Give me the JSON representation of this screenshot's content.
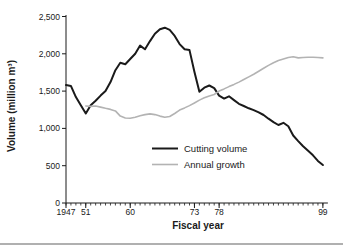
{
  "page": {
    "background": "#ffffff",
    "bottom_rule_color": "#b0b0b0"
  },
  "chart_data": {
    "type": "line",
    "title": "",
    "xlabel": "Fiscal year",
    "ylabel": "Volume (million m³)",
    "xlim": [
      1947,
      1999
    ],
    "ylim": [
      0,
      2500
    ],
    "grid": false,
    "legend_position": "center-right",
    "axis_color": "#1a1a1a",
    "x_minor_tick_interval": 1,
    "x_major_ticks": [
      {
        "year": 1947,
        "label": "1947"
      },
      {
        "year": 1951,
        "label": "51"
      },
      {
        "year": 1960,
        "label": "60"
      },
      {
        "year": 1973,
        "label": "73"
      },
      {
        "year": 1978,
        "label": "78"
      },
      {
        "year": 1999,
        "label": "99"
      }
    ],
    "y_ticks": [
      {
        "value": 0,
        "label": "0"
      },
      {
        "value": 500,
        "label": "500"
      },
      {
        "value": 1000,
        "label": "1,000"
      },
      {
        "value": 1500,
        "label": "1,500"
      },
      {
        "value": 2000,
        "label": "2,000"
      },
      {
        "value": 2500,
        "label": "2,500"
      }
    ],
    "series": [
      {
        "name": "Cutting volume",
        "color": "#1a1a1a",
        "stroke_width": 2,
        "years": [
          1947,
          1948,
          1949,
          1950,
          1951,
          1952,
          1953,
          1954,
          1955,
          1956,
          1957,
          1958,
          1959,
          1960,
          1961,
          1962,
          1963,
          1964,
          1965,
          1966,
          1967,
          1968,
          1969,
          1970,
          1971,
          1972,
          1973,
          1974,
          1975,
          1976,
          1977,
          1978,
          1979,
          1980,
          1981,
          1982,
          1983,
          1984,
          1985,
          1986,
          1987,
          1988,
          1989,
          1990,
          1991,
          1992,
          1993,
          1994,
          1995,
          1996,
          1997,
          1998,
          1999
        ],
        "values": [
          1580,
          1570,
          1420,
          1310,
          1200,
          1310,
          1370,
          1440,
          1500,
          1620,
          1780,
          1880,
          1860,
          1930,
          2000,
          2110,
          2060,
          2170,
          2270,
          2330,
          2350,
          2320,
          2240,
          2130,
          2060,
          2050,
          1760,
          1490,
          1545,
          1575,
          1540,
          1440,
          1400,
          1430,
          1380,
          1330,
          1300,
          1270,
          1245,
          1215,
          1180,
          1130,
          1085,
          1045,
          1075,
          1030,
          905,
          830,
          760,
          700,
          640,
          565,
          510
        ]
      },
      {
        "name": "Annual growth",
        "color": "#b3b3b3",
        "stroke_width": 1.6,
        "years": [
          1951,
          1952,
          1953,
          1954,
          1955,
          1956,
          1957,
          1958,
          1959,
          1960,
          1961,
          1962,
          1963,
          1964,
          1965,
          1966,
          1967,
          1968,
          1969,
          1970,
          1971,
          1972,
          1973,
          1974,
          1975,
          1976,
          1977,
          1978,
          1979,
          1980,
          1981,
          1982,
          1983,
          1984,
          1985,
          1986,
          1987,
          1988,
          1989,
          1990,
          1991,
          1992,
          1993,
          1994,
          1995,
          1996,
          1997,
          1998,
          1999
        ],
        "values": [
          1300,
          1295,
          1300,
          1285,
          1270,
          1255,
          1235,
          1165,
          1140,
          1135,
          1150,
          1170,
          1185,
          1195,
          1185,
          1165,
          1150,
          1160,
          1200,
          1245,
          1275,
          1305,
          1340,
          1380,
          1410,
          1435,
          1455,
          1500,
          1530,
          1560,
          1590,
          1620,
          1655,
          1690,
          1725,
          1765,
          1805,
          1845,
          1880,
          1910,
          1930,
          1950,
          1960,
          1945,
          1950,
          1955,
          1955,
          1950,
          1945
        ]
      }
    ]
  }
}
